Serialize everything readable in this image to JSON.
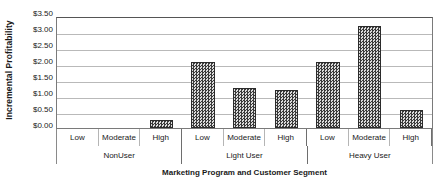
{
  "chart_data": {
    "type": "bar",
    "title": "",
    "xlabel": "Marketing Program and Customer Segment",
    "ylabel": "Incremental Profitability",
    "ylim": [
      0,
      3.5
    ],
    "ytick_step": 0.5,
    "ytick_labels": [
      "$3.50",
      "$3.00",
      "$2.50",
      "$2.00",
      "$1.50",
      "$1.00",
      "$0.50",
      "$0.00"
    ],
    "ytick_values": [
      3.5,
      3.0,
      2.5,
      2.0,
      1.5,
      1.0,
      0.5,
      0.0
    ],
    "grid": true,
    "legend": "none",
    "bar_color": "#4c4c4c",
    "bar_pattern": "checkered-crosshatch",
    "categories": [
      "Low",
      "Moderate",
      "High",
      "Low",
      "Moderate",
      "High",
      "Low",
      "Moderate",
      "High"
    ],
    "values": [
      0.0,
      0.0,
      0.25,
      2.05,
      1.25,
      1.2,
      2.05,
      3.2,
      0.55
    ],
    "groups": [
      {
        "label": "NonUser",
        "span": 3
      },
      {
        "label": "Light User",
        "span": 3
      },
      {
        "label": "Heavy User",
        "span": 3
      }
    ],
    "bars": [
      {
        "group": "NonUser",
        "category": "Low",
        "value": 0.0
      },
      {
        "group": "NonUser",
        "category": "Moderate",
        "value": 0.0
      },
      {
        "group": "NonUser",
        "category": "High",
        "value": 0.25
      },
      {
        "group": "Light User",
        "category": "Low",
        "value": 2.05
      },
      {
        "group": "Light User",
        "category": "Moderate",
        "value": 1.25
      },
      {
        "group": "Light User",
        "category": "High",
        "value": 1.2
      },
      {
        "group": "Heavy User",
        "category": "Low",
        "value": 2.05
      },
      {
        "group": "Heavy User",
        "category": "Moderate",
        "value": 3.2
      },
      {
        "group": "Heavy User",
        "category": "High",
        "value": 0.55
      }
    ]
  }
}
